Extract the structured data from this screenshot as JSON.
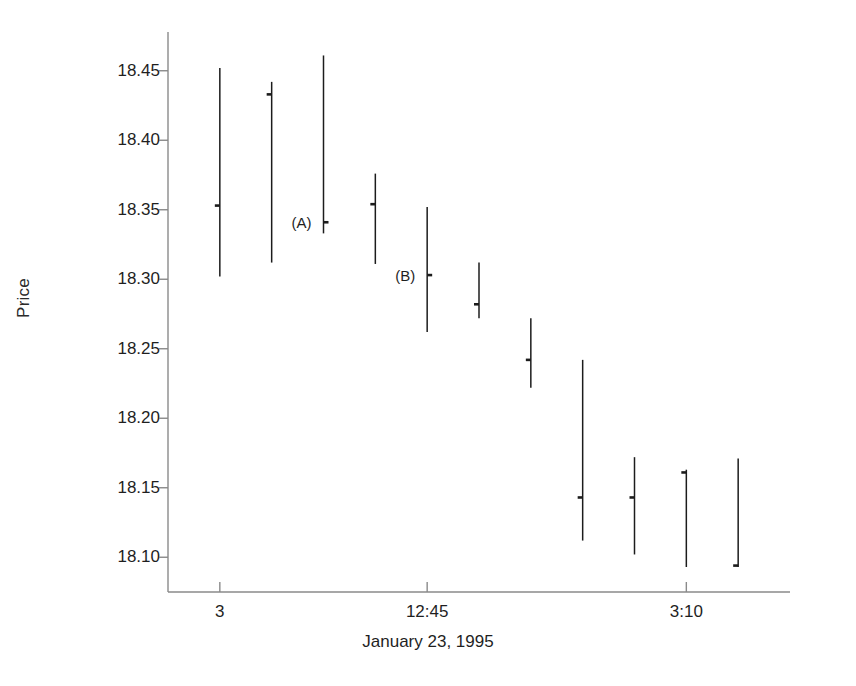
{
  "chart_data": {
    "type": "bar",
    "subtype": "vertical-range-bars-with-tick",
    "title": "",
    "xlabel": "January 23, 1995",
    "ylabel": "Price",
    "ylim": [
      18.075,
      18.475
    ],
    "yticks": [
      18.45,
      18.4,
      18.35,
      18.3,
      18.25,
      18.2,
      18.15,
      18.1
    ],
    "ytick_labels": [
      "18.45",
      "18.40",
      "18.35",
      "18.30",
      "18.25",
      "18.20",
      "18.15",
      "18.10"
    ],
    "xlim": [
      0,
      12
    ],
    "xticks": [
      1,
      5,
      10
    ],
    "xtick_labels": [
      "3",
      "12:45",
      "3:10"
    ],
    "grid": false,
    "legend": null,
    "series": [
      {
        "name": "Price range bars",
        "bars": [
          {
            "x": 1,
            "high": 18.452,
            "low": 18.302,
            "mark": 18.353,
            "mark_side": "left"
          },
          {
            "x": 2,
            "high": 18.442,
            "low": 18.312,
            "mark": 18.433,
            "mark_side": "left"
          },
          {
            "x": 3,
            "high": 18.461,
            "low": 18.333,
            "mark": 18.341,
            "mark_side": "right",
            "annotation": "(A)"
          },
          {
            "x": 4,
            "high": 18.376,
            "low": 18.311,
            "mark": 18.354,
            "mark_side": "left"
          },
          {
            "x": 5,
            "high": 18.352,
            "low": 18.262,
            "mark": 18.303,
            "mark_side": "right",
            "annotation": "(B)"
          },
          {
            "x": 6,
            "high": 18.312,
            "low": 18.272,
            "mark": 18.282,
            "mark_side": "left"
          },
          {
            "x": 7,
            "high": 18.272,
            "low": 18.222,
            "mark": 18.242,
            "mark_side": "left"
          },
          {
            "x": 8,
            "high": 18.242,
            "low": 18.112,
            "mark": 18.143,
            "mark_side": "left"
          },
          {
            "x": 9,
            "high": 18.172,
            "low": 18.102,
            "mark": 18.143,
            "mark_side": "left"
          },
          {
            "x": 10,
            "high": 18.163,
            "low": 18.093,
            "mark": 18.161,
            "mark_side": "left"
          },
          {
            "x": 11,
            "high": 18.171,
            "low": 18.093,
            "mark": 18.094,
            "mark_side": "left"
          }
        ]
      }
    ],
    "annotations": [
      {
        "label": "(A)",
        "at_x": 3,
        "at_y": 18.341
      },
      {
        "label": "(B)",
        "at_x": 5,
        "at_y": 18.303
      }
    ],
    "axis_color": "#8a8a8a",
    "bar_color": "#1c1c1c"
  }
}
